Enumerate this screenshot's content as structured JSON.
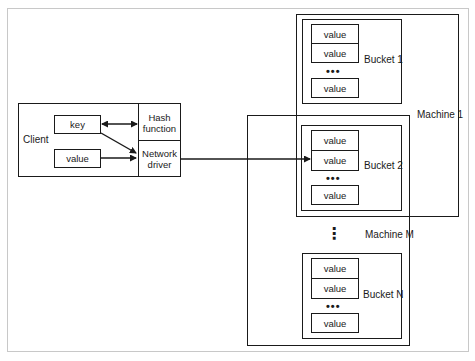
{
  "client": {
    "label": "Client",
    "key_label": "key",
    "value_label": "value",
    "hash_function_label": "Hash function",
    "network_driver_label": "Network driver"
  },
  "machines": [
    {
      "label": "Machine 1",
      "buckets": [
        {
          "label": "Bucket 1",
          "values": [
            "value",
            "value",
            "value"
          ],
          "ellipsis": "•••"
        }
      ]
    },
    {
      "label": "Machine M",
      "buckets": [
        {
          "label": "Bucket 2",
          "values": [
            "value",
            "value",
            "value"
          ],
          "ellipsis": "•••"
        },
        {
          "label": "Bucket N",
          "values": [
            "value",
            "value",
            "value"
          ],
          "ellipsis": "•••"
        }
      ],
      "vertical_ellipsis": "⋮"
    }
  ],
  "colors": {
    "line": "#1a1a1a",
    "frame": "#c8c8c8",
    "background": "#ffffff"
  }
}
